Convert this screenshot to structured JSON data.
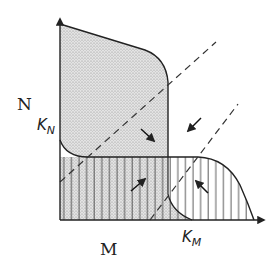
{
  "diagram": {
    "type": "phase-plane competition diagram",
    "y_axis_label": "N",
    "x_axis_label": "M",
    "k_n_label": {
      "main": "K",
      "sub": "N"
    },
    "k_m_label": {
      "main": "K",
      "sub": "M"
    },
    "regions": [
      {
        "name": "N-dominant region",
        "fill": "stippled",
        "color": "#c8c8c8"
      },
      {
        "name": "M-dominant region",
        "fill": "vertical-hatch",
        "color": "#555555"
      }
    ],
    "lines": [
      {
        "name": "dashed-diagonal-upper",
        "style": "dashed"
      },
      {
        "name": "dashed-diagonal-lower",
        "style": "dashed"
      }
    ],
    "arrows": [
      {
        "name": "arrow-down-right",
        "direction": "down-right"
      },
      {
        "name": "arrow-down-left",
        "direction": "down-left"
      },
      {
        "name": "arrow-up-right",
        "direction": "up-right"
      },
      {
        "name": "arrow-up-left",
        "direction": "up-left"
      }
    ],
    "colors": {
      "ink": "#222222",
      "stipple": "#c9c9c9",
      "hatch": "#444444",
      "background": "#ffffff"
    }
  }
}
